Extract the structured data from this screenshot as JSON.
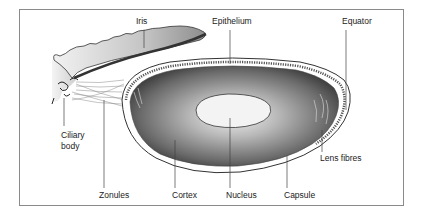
{
  "diagram": {
    "type": "anatomical illustration",
    "labels": {
      "iris": "Iris",
      "epithelium": "Epithelium",
      "equator": "Equator",
      "ciliary_body_line1": "Ciliary",
      "ciliary_body_line2": "body",
      "lens_fibres": "Lens fibres",
      "zonules": "Zonules",
      "cortex": "Cortex",
      "nucleus": "Nucleus",
      "capsule": "Capsule"
    },
    "colors": {
      "frame": "#8a8a8a",
      "leader_lines": "#444444",
      "nucleus": "#f2f2f2",
      "cortex_dark": "#3a3a3a",
      "iris_fill": "#bdbdbd"
    }
  }
}
